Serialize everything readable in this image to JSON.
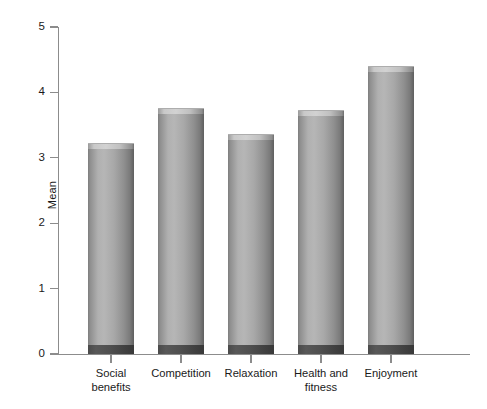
{
  "chart_data": {
    "type": "bar",
    "title": "",
    "xlabel": "",
    "ylabel": "Mean",
    "ylim": [
      0,
      5
    ],
    "ytick_labels": [
      "5",
      "4",
      "3",
      "2",
      "1",
      "0"
    ],
    "yticks": [
      5,
      4,
      3,
      2,
      1,
      0
    ],
    "grid": false,
    "legend": null,
    "categories": [
      "Social benefits",
      "Competition",
      "Relaxation",
      "Health and fitness",
      "Enjoyment"
    ],
    "category_lines": [
      [
        "Social",
        "benefits"
      ],
      [
        "Competition"
      ],
      [
        "Relaxation"
      ],
      [
        "Health and",
        "fitness"
      ],
      [
        "Enjoyment"
      ]
    ],
    "values": [
      3.15,
      3.68,
      3.28,
      3.65,
      4.32
    ],
    "bar_style": "3d-cylinder",
    "colors": {
      "bar_light": "#b6b6b6",
      "bar_mid": "#8f8f8f",
      "bar_dark": "#5f5f5f",
      "bar_base": "#4a4a4a",
      "axis": "#8c8c8c",
      "text": "#1a1a1a",
      "background": "#ffffff"
    }
  },
  "axes": {
    "y": {
      "label": "Mean",
      "ticks": [
        {
          "label": "5"
        },
        {
          "label": "4"
        },
        {
          "label": "3"
        },
        {
          "label": "2"
        },
        {
          "label": "1"
        },
        {
          "label": "0"
        }
      ]
    }
  }
}
